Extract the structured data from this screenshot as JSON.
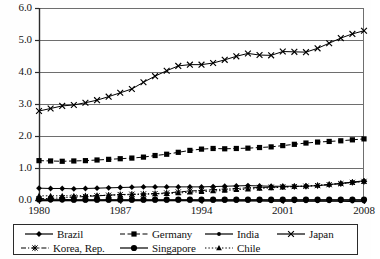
{
  "chart_data": {
    "type": "line",
    "title": "",
    "subtitle": "",
    "xlabel": "",
    "ylabel": "",
    "xlim": [
      1980,
      2008
    ],
    "ylim": [
      0.0,
      6.0
    ],
    "grid": true,
    "legend_position": "bottom",
    "y_ticks": [
      "0.0",
      "1.0",
      "2.0",
      "3.0",
      "4.0",
      "5.0",
      "6.0"
    ],
    "y_tick_values": [
      0.0,
      1.0,
      2.0,
      3.0,
      4.0,
      5.0,
      6.0
    ],
    "x_ticks": [
      "1980",
      "1987",
      "1994",
      "2001",
      "2008"
    ],
    "x_tick_values": [
      1980,
      1987,
      1994,
      2001,
      2008
    ],
    "x": [
      1980,
      1981,
      1982,
      1983,
      1984,
      1985,
      1986,
      1987,
      1988,
      1989,
      1990,
      1991,
      1992,
      1993,
      1994,
      1995,
      1996,
      1997,
      1998,
      1999,
      2000,
      2001,
      2002,
      2003,
      2004,
      2005,
      2006,
      2007,
      2008
    ],
    "series": [
      {
        "name": "Brazil",
        "marker": "diamond",
        "line_style": "solid",
        "color": "#000000",
        "values": [
          0.37,
          0.36,
          0.36,
          0.35,
          0.36,
          0.37,
          0.38,
          0.39,
          0.4,
          0.41,
          0.41,
          0.41,
          0.41,
          0.41,
          0.41,
          0.42,
          0.43,
          0.44,
          0.45,
          0.44,
          0.43,
          0.43,
          0.43,
          0.43,
          0.45,
          0.48,
          0.52,
          0.56,
          0.6
        ]
      },
      {
        "name": "Germany",
        "marker": "square",
        "line_style": "dashed",
        "color": "#000000",
        "values": [
          1.23,
          1.22,
          1.21,
          1.22,
          1.23,
          1.25,
          1.27,
          1.29,
          1.31,
          1.34,
          1.39,
          1.43,
          1.49,
          1.55,
          1.59,
          1.61,
          1.6,
          1.61,
          1.62,
          1.64,
          1.66,
          1.7,
          1.74,
          1.78,
          1.81,
          1.83,
          1.85,
          1.88,
          1.91
        ]
      },
      {
        "name": "India",
        "marker": "circle-small",
        "line_style": "solid",
        "color": "#000000",
        "values": [
          -0.02,
          -0.02,
          -0.02,
          -0.02,
          -0.02,
          -0.02,
          -0.02,
          -0.02,
          -0.02,
          -0.02,
          -0.02,
          -0.02,
          -0.02,
          -0.02,
          -0.03,
          -0.03,
          -0.03,
          -0.03,
          -0.03,
          -0.03,
          -0.04,
          -0.04,
          -0.04,
          -0.04,
          -0.04,
          -0.04,
          -0.04,
          -0.05,
          -0.05
        ]
      },
      {
        "name": "Japan",
        "marker": "x",
        "line_style": "solid",
        "color": "#000000",
        "values": [
          2.78,
          2.86,
          2.94,
          2.97,
          3.04,
          3.12,
          3.23,
          3.35,
          3.47,
          3.68,
          3.87,
          4.04,
          4.19,
          4.23,
          4.23,
          4.28,
          4.38,
          4.49,
          4.58,
          4.53,
          4.52,
          4.64,
          4.63,
          4.62,
          4.74,
          4.9,
          5.06,
          5.19,
          5.29
        ]
      },
      {
        "name": "Korea, Rep.",
        "marker": "asterisk",
        "line_style": "dash-dot",
        "color": "#000000",
        "values": [
          0.04,
          0.05,
          0.07,
          0.09,
          0.11,
          0.13,
          0.15,
          0.17,
          0.18,
          0.19,
          0.2,
          0.22,
          0.25,
          0.28,
          0.3,
          0.32,
          0.34,
          0.36,
          0.38,
          0.39,
          0.4,
          0.41,
          0.42,
          0.43,
          0.45,
          0.48,
          0.51,
          0.55,
          0.58
        ]
      },
      {
        "name": "Singapore",
        "marker": "circle-large",
        "line_style": "solid",
        "color": "#000000",
        "values": [
          0.02,
          0.02,
          0.02,
          0.01,
          0.01,
          0.01,
          0.01,
          0.01,
          0.01,
          0.01,
          0.01,
          0.01,
          0.01,
          0.01,
          0.01,
          0.01,
          0.01,
          0.01,
          0.01,
          0.01,
          0.01,
          0.01,
          0.01,
          0.01,
          0.01,
          0.01,
          0.01,
          0.01,
          0.01
        ]
      },
      {
        "name": "Chile",
        "marker": "triangle",
        "line_style": "dotted",
        "color": "#000000",
        "values": [
          0.13,
          0.13,
          0.13,
          0.13,
          0.14,
          0.14,
          0.15,
          0.16,
          0.17,
          0.18,
          0.19,
          0.2,
          0.22,
          0.24,
          0.26,
          0.28,
          0.3,
          0.32,
          0.34,
          0.36,
          0.38,
          0.4,
          0.42,
          0.44,
          0.46,
          0.49,
          0.52,
          0.55,
          0.58
        ]
      }
    ]
  },
  "legend": {
    "rows": [
      [
        {
          "label": "Brazil",
          "series": "Brazil"
        },
        {
          "label": "Germany",
          "series": "Germany"
        },
        {
          "label": "India",
          "series": "India"
        },
        {
          "label": "Japan",
          "series": "Japan"
        }
      ],
      [
        {
          "label": "Korea, Rep.",
          "series": "Korea, Rep."
        },
        {
          "label": "Singapore",
          "series": "Singapore"
        },
        {
          "label": "Chile",
          "series": "Chile"
        }
      ]
    ]
  },
  "style": {
    "axis_color": "#2b2b2b",
    "grid_color": "#6e6e6e",
    "plot_bg": "#ffffff",
    "series_color": "#000000"
  }
}
